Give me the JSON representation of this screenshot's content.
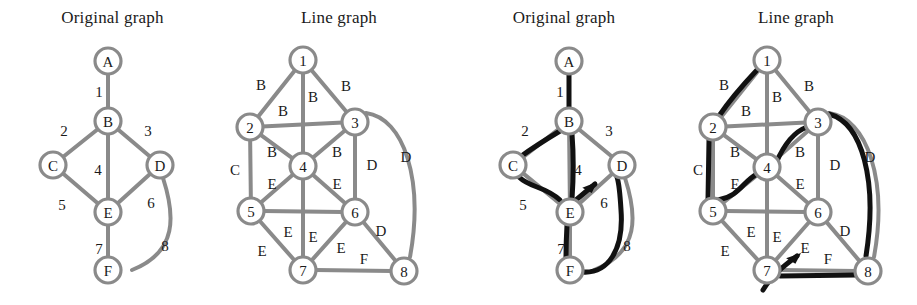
{
  "figure": {
    "width": 917,
    "height": 305,
    "background": "#ffffff",
    "edge_color": "#8a8a8a",
    "node_ring_color": "#8a8a8a",
    "node_fill": "#ffffff",
    "label_color": "#1a1a1a",
    "highlight_color": "#111111",
    "node_radius": 13,
    "edge_width": 4,
    "highlight_width": 5
  },
  "panels": [
    {
      "id": "panel-original-1",
      "title": "Original graph",
      "x": 0,
      "width": 225,
      "nodes": [
        {
          "id": "A",
          "label": "A",
          "x": 108,
          "y": 61
        },
        {
          "id": "B",
          "label": "B",
          "x": 108,
          "y": 121
        },
        {
          "id": "C",
          "label": "C",
          "x": 53,
          "y": 165
        },
        {
          "id": "D",
          "label": "D",
          "x": 160,
          "y": 165
        },
        {
          "id": "E",
          "label": "E",
          "x": 108,
          "y": 212
        },
        {
          "id": "F",
          "label": "F",
          "x": 108,
          "y": 270
        }
      ],
      "edges": [
        {
          "id": "1",
          "label": "1",
          "from": "A",
          "to": "B",
          "curve": null,
          "lx": 99,
          "ly": 92
        },
        {
          "id": "2",
          "label": "2",
          "from": "B",
          "to": "C",
          "curve": null,
          "lx": 64,
          "ly": 131
        },
        {
          "id": "3",
          "label": "3",
          "from": "B",
          "to": "D",
          "curve": null,
          "lx": 148,
          "ly": 131
        },
        {
          "id": "4",
          "label": "4",
          "from": "B",
          "to": "E",
          "curve": null,
          "lx": 98,
          "ly": 170
        },
        {
          "id": "5",
          "label": "5",
          "from": "C",
          "to": "E",
          "curve": null,
          "lx": 62,
          "ly": 205
        },
        {
          "id": "6",
          "label": "6",
          "from": "D",
          "to": "E",
          "curve": null,
          "lx": 151,
          "ly": 203
        },
        {
          "id": "7",
          "label": "7",
          "from": "E",
          "to": "F",
          "curve": null,
          "lx": 99,
          "ly": 249
        },
        {
          "id": "8",
          "label": "8",
          "from": "D",
          "to": "F",
          "curve": "M 163 178 C 175 215 178 252 132 270",
          "lx": 165,
          "ly": 246
        }
      ],
      "highlight_path": [],
      "arrow": null
    },
    {
      "id": "panel-line-1",
      "title": "Line graph",
      "x": 225,
      "width": 228,
      "nodes": [
        {
          "id": "1",
          "label": "1",
          "x": 303,
          "y": 60
        },
        {
          "id": "2",
          "label": "2",
          "x": 250,
          "y": 127
        },
        {
          "id": "3",
          "label": "3",
          "x": 355,
          "y": 122
        },
        {
          "id": "4",
          "label": "4",
          "x": 303,
          "y": 166
        },
        {
          "id": "5",
          "label": "5",
          "x": 251,
          "y": 211
        },
        {
          "id": "6",
          "label": "6",
          "x": 355,
          "y": 212
        },
        {
          "id": "7",
          "label": "7",
          "x": 303,
          "y": 270
        },
        {
          "id": "8",
          "label": "8",
          "x": 404,
          "y": 271
        }
      ],
      "edges": [
        {
          "id": "e12",
          "label": "B",
          "from": "1",
          "to": "2",
          "curve": null,
          "lx": 261,
          "ly": 85
        },
        {
          "id": "e13",
          "label": "B",
          "from": "1",
          "to": "3",
          "curve": null,
          "lx": 346,
          "ly": 86
        },
        {
          "id": "e14",
          "label": "B",
          "from": "1",
          "to": "4",
          "curve": null,
          "lx": 313,
          "ly": 97
        },
        {
          "id": "e23",
          "label": "B",
          "from": "2",
          "to": "3",
          "curve": null,
          "lx": 283,
          "ly": 111
        },
        {
          "id": "e24",
          "label": "B",
          "from": "2",
          "to": "4",
          "curve": null,
          "lx": 272,
          "ly": 152
        },
        {
          "id": "e34",
          "label": "B",
          "from": "3",
          "to": "4",
          "curve": null,
          "lx": 337,
          "ly": 152
        },
        {
          "id": "e25",
          "label": "C",
          "from": "2",
          "to": "5",
          "curve": null,
          "lx": 235,
          "ly": 170
        },
        {
          "id": "e36",
          "label": "D",
          "from": "3",
          "to": "6",
          "curve": null,
          "lx": 372,
          "ly": 165
        },
        {
          "id": "e38",
          "label": "D",
          "from": "3",
          "to": "8",
          "curve": "M 366 113 C 404 118 424 180 410 257",
          "lx": 406,
          "ly": 157
        },
        {
          "id": "e45",
          "label": "E",
          "from": "4",
          "to": "5",
          "curve": null,
          "lx": 272,
          "ly": 184
        },
        {
          "id": "e46",
          "label": "E",
          "from": "4",
          "to": "6",
          "curve": null,
          "lx": 337,
          "ly": 184
        },
        {
          "id": "e47",
          "label": "E",
          "from": "4",
          "to": "7",
          "curve": null,
          "lx": 313,
          "ly": 237
        },
        {
          "id": "e56",
          "label": "E",
          "from": "5",
          "to": "6",
          "curve": null,
          "lx": 288,
          "ly": 232
        },
        {
          "id": "e57",
          "label": "E",
          "from": "5",
          "to": "7",
          "curve": null,
          "lx": 262,
          "ly": 251
        },
        {
          "id": "e67",
          "label": "E",
          "from": "6",
          "to": "7",
          "curve": null,
          "lx": 341,
          "ly": 248
        },
        {
          "id": "e68",
          "label": "D",
          "from": "6",
          "to": "8",
          "curve": null,
          "lx": 381,
          "ly": 231
        },
        {
          "id": "e78",
          "label": "F",
          "from": "7",
          "to": "8",
          "curve": null,
          "lx": 364,
          "ly": 259
        }
      ],
      "highlight_path": [],
      "arrow": null
    },
    {
      "id": "panel-original-2",
      "title": "Original graph",
      "x": 453,
      "width": 222,
      "nodes": [
        {
          "id": "A",
          "label": "A",
          "x": 569,
          "y": 61
        },
        {
          "id": "B",
          "label": "B",
          "x": 569,
          "y": 121
        },
        {
          "id": "C",
          "label": "C",
          "x": 513,
          "y": 165
        },
        {
          "id": "D",
          "label": "D",
          "x": 622,
          "y": 165
        },
        {
          "id": "E",
          "label": "E",
          "x": 570,
          "y": 212
        },
        {
          "id": "F",
          "label": "F",
          "x": 570,
          "y": 270
        }
      ],
      "edges": [
        {
          "id": "1",
          "label": "1",
          "from": "A",
          "to": "B",
          "curve": null,
          "lx": 560,
          "ly": 92
        },
        {
          "id": "2",
          "label": "2",
          "from": "B",
          "to": "C",
          "curve": null,
          "lx": 525,
          "ly": 131
        },
        {
          "id": "3",
          "label": "3",
          "from": "B",
          "to": "D",
          "curve": null,
          "lx": 609,
          "ly": 131
        },
        {
          "id": "4",
          "label": "4",
          "from": "B",
          "to": "E",
          "curve": null,
          "lx": 578,
          "ly": 170
        },
        {
          "id": "5",
          "label": "5",
          "from": "C",
          "to": "E",
          "curve": null,
          "lx": 523,
          "ly": 205
        },
        {
          "id": "6",
          "label": "6",
          "from": "D",
          "to": "E",
          "curve": null,
          "lx": 604,
          "ly": 203
        },
        {
          "id": "7",
          "label": "7",
          "from": "E",
          "to": "F",
          "curve": null,
          "lx": 561,
          "ly": 249
        },
        {
          "id": "8",
          "label": "8",
          "from": "D",
          "to": "F",
          "curve": "M 625 178 C 637 215 640 252 594 270",
          "lx": 627,
          "ly": 246
        }
      ],
      "highlight_path": [
        {
          "id": "h1",
          "d": "M 569 74 L 569 108"
        },
        {
          "id": "h2",
          "d": "M 560 131 C 540 143 527 152 520 157"
        },
        {
          "id": "h5",
          "d": "M 519 177 C 530 188 545 186 560 200"
        },
        {
          "id": "h4",
          "d": "M 572 134 C 574 160 573 185 572 199"
        },
        {
          "id": "h7",
          "d": "M 567 225 C 566 243 566 256 566 258"
        },
        {
          "id": "h8",
          "d": "M 582 272 C 608 274 624 250 621 210 C 620 193 619 183 617 177"
        }
      ],
      "arrow": {
        "id": "arrow-to-D",
        "d": "M 570 205 L 595 184",
        "tip_x": 597,
        "tip_y": 182,
        "angle": -40
      }
    },
    {
      "id": "panel-line-2",
      "title": "Line graph",
      "x": 675,
      "width": 242,
      "nodes": [
        {
          "id": "1",
          "label": "1",
          "x": 767,
          "y": 60
        },
        {
          "id": "2",
          "label": "2",
          "x": 713,
          "y": 127
        },
        {
          "id": "3",
          "label": "3",
          "x": 818,
          "y": 122
        },
        {
          "id": "4",
          "label": "4",
          "x": 767,
          "y": 167
        },
        {
          "id": "5",
          "label": "5",
          "x": 713,
          "y": 211
        },
        {
          "id": "6",
          "label": "6",
          "x": 818,
          "y": 212
        },
        {
          "id": "7",
          "label": "7",
          "x": 767,
          "y": 270
        },
        {
          "id": "8",
          "label": "8",
          "x": 868,
          "y": 271
        }
      ],
      "edges": [
        {
          "id": "e12",
          "label": "B",
          "from": "1",
          "to": "2",
          "curve": null,
          "lx": 724,
          "ly": 85
        },
        {
          "id": "e13",
          "label": "B",
          "from": "1",
          "to": "3",
          "curve": null,
          "lx": 809,
          "ly": 86
        },
        {
          "id": "e14",
          "label": "B",
          "from": "1",
          "to": "4",
          "curve": null,
          "lx": 777,
          "ly": 97
        },
        {
          "id": "e23",
          "label": "B",
          "from": "2",
          "to": "3",
          "curve": null,
          "lx": 746,
          "ly": 111
        },
        {
          "id": "e24",
          "label": "B",
          "from": "2",
          "to": "4",
          "curve": null,
          "lx": 735,
          "ly": 152
        },
        {
          "id": "e34",
          "label": "B",
          "from": "3",
          "to": "4",
          "curve": null,
          "lx": 800,
          "ly": 152
        },
        {
          "id": "e25",
          "label": "C",
          "from": "2",
          "to": "5",
          "curve": null,
          "lx": 698,
          "ly": 170
        },
        {
          "id": "e36",
          "label": "D",
          "from": "3",
          "to": "6",
          "curve": null,
          "lx": 835,
          "ly": 165
        },
        {
          "id": "e38",
          "label": "D",
          "from": "3",
          "to": "8",
          "curve": "M 829 113 C 867 118 888 180 874 257",
          "lx": 870,
          "ly": 157
        },
        {
          "id": "e45",
          "label": "E",
          "from": "4",
          "to": "5",
          "curve": null,
          "lx": 735,
          "ly": 184
        },
        {
          "id": "e46",
          "label": "E",
          "from": "4",
          "to": "6",
          "curve": null,
          "lx": 800,
          "ly": 184
        },
        {
          "id": "e47",
          "label": "E",
          "from": "4",
          "to": "7",
          "curve": null,
          "lx": 777,
          "ly": 237
        },
        {
          "id": "e56",
          "label": "E",
          "from": "5",
          "to": "6",
          "curve": null,
          "lx": 751,
          "ly": 232
        },
        {
          "id": "e57",
          "label": "E",
          "from": "5",
          "to": "7",
          "curve": null,
          "lx": 725,
          "ly": 251
        },
        {
          "id": "e67",
          "label": "E",
          "from": "6",
          "to": "7",
          "curve": null,
          "lx": 805,
          "ly": 248
        },
        {
          "id": "e68",
          "label": "D",
          "from": "6",
          "to": "8",
          "curve": null,
          "lx": 845,
          "ly": 231
        },
        {
          "id": "e78",
          "label": "F",
          "from": "7",
          "to": "8",
          "curve": null,
          "lx": 828,
          "ly": 259
        }
      ],
      "highlight_path": [
        {
          "id": "h12",
          "d": "M 757 70 C 740 88 727 104 719 116"
        },
        {
          "id": "h25",
          "d": "M 709 140 L 708 199"
        },
        {
          "id": "h54",
          "d": "M 718 200 C 740 196 742 182 757 174"
        },
        {
          "id": "h43",
          "d": "M 776 163 C 786 140 796 131 807 127"
        },
        {
          "id": "h38",
          "d": "M 829 114 C 862 123 878 180 866 256"
        },
        {
          "id": "h87",
          "d": "M 856 275 L 780 276"
        }
      ],
      "arrow": {
        "id": "arrow-to-6",
        "d": "M 763 290 C 772 275 785 265 797 256",
        "tip_x": 801,
        "tip_y": 253,
        "angle": -38
      }
    }
  ]
}
